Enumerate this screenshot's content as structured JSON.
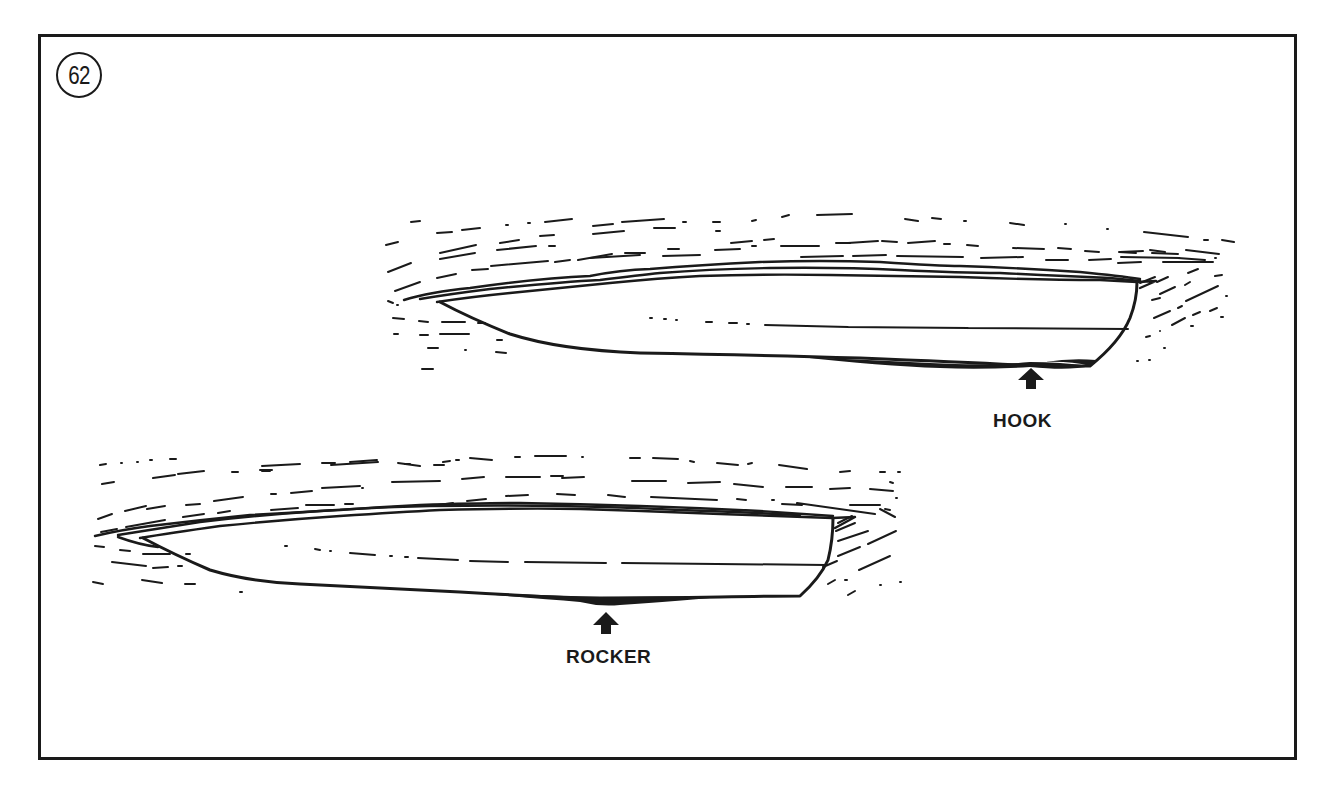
{
  "figure": {
    "number": "62",
    "border_color": "#1a1a1a",
    "background": "#ffffff"
  },
  "boats": [
    {
      "id": "upper",
      "description": "Planing hull with hook at the stern bottom",
      "callout": {
        "label": "HOOK",
        "arrow": "up-arrow-icon"
      }
    },
    {
      "id": "lower",
      "description": "Planing hull with rocker mid-bottom",
      "callout": {
        "label": "ROCKER",
        "arrow": "up-arrow-icon"
      }
    }
  ]
}
